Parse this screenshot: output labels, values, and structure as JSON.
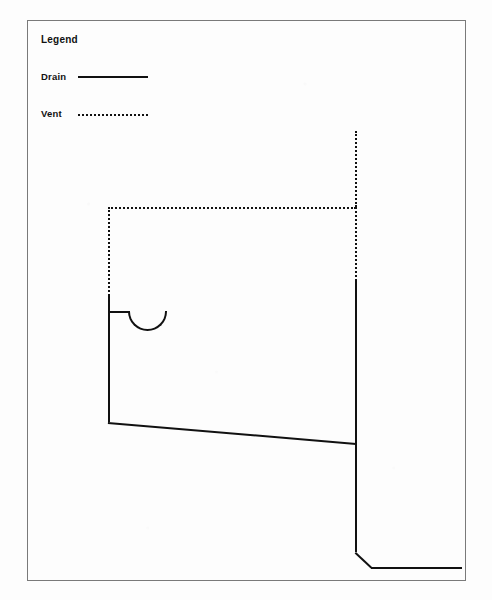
{
  "drawing": {
    "title": "Plumbing drain-waste-vent riser diagram",
    "background_color": "#fdfdfd",
    "line_color": "#111111",
    "frame_color": "#7a7a7a"
  },
  "legend": {
    "title": "Legend",
    "entries": [
      {
        "label": "Drain",
        "style": "solid",
        "sample_name": "drain-line-sample"
      },
      {
        "label": "Vent",
        "style": "dotted",
        "sample_name": "vent-line-sample"
      }
    ]
  },
  "diagram": {
    "vent_segments": [
      {
        "name": "vent-stack-upper",
        "orientation": "vertical",
        "x": 355,
        "y1": 131,
        "y2": 207
      },
      {
        "name": "vent-horizontal-branch",
        "orientation": "horizontal",
        "y": 207,
        "x1": 108,
        "x2": 356
      },
      {
        "name": "vent-riser-left",
        "orientation": "vertical",
        "x": 108,
        "y1": 207,
        "y2": 296
      },
      {
        "name": "vent-stack-middle",
        "orientation": "vertical",
        "x": 355,
        "y1": 207,
        "y2": 281
      }
    ],
    "drain_segments": [
      {
        "name": "fixture-drop-left",
        "orientation": "vertical",
        "x": 108,
        "y1": 296,
        "y2": 422
      },
      {
        "name": "trap-inlet-stub",
        "orientation": "horizontal",
        "y": 311,
        "x1": 108,
        "x2": 129
      },
      {
        "name": "p-trap-arc",
        "shape": "semicircle",
        "cx": 147,
        "cy": 311,
        "r": 20
      },
      {
        "name": "sloped-branch-drain",
        "shape": "diagonal",
        "x1": 108,
        "y1": 422,
        "x2": 356,
        "y2": 443
      },
      {
        "name": "main-stack",
        "orientation": "vertical",
        "x": 355,
        "y1": 281,
        "y2": 552
      },
      {
        "name": "stack-offset-elbow",
        "shape": "diagonal",
        "x1": 356,
        "y1": 552,
        "x2": 372,
        "y2": 567
      },
      {
        "name": "building-sewer-run",
        "orientation": "horizontal",
        "y": 567,
        "x1": 371,
        "x2": 462
      }
    ]
  }
}
